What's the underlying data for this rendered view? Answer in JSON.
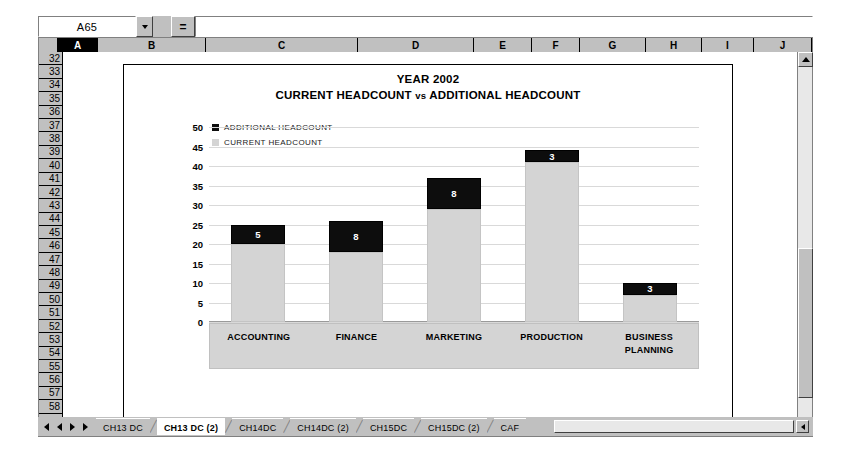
{
  "formula_bar": {
    "name_box_value": "A65",
    "equals_label": "=",
    "formula_value": "",
    "dropdown_icon": "chevron-down-icon"
  },
  "grid": {
    "columns": [
      "A",
      "B",
      "C",
      "D",
      "E",
      "F",
      "G",
      "H",
      "I",
      "J"
    ],
    "column_widths": [
      40,
      108,
      152,
      116,
      58,
      48,
      66,
      56,
      52,
      58
    ],
    "selected_column": "A",
    "rows": [
      32,
      33,
      34,
      35,
      36,
      37,
      38,
      39,
      40,
      41,
      42,
      43,
      44,
      45,
      46,
      47,
      48,
      49,
      50,
      51,
      52,
      53,
      54,
      55,
      56,
      57,
      58
    ]
  },
  "chart_data": {
    "type": "bar",
    "title": "YEAR 2002",
    "subtitle_parts": {
      "left": "CURRENT HEADCOUNT",
      "middle": "vs",
      "right": "ADDITIONAL HEADCOUNT"
    },
    "subtitle": "CURRENT HEADCOUNT vs ADDITIONAL HEADCOUNT",
    "stacked": true,
    "xlabel": "",
    "ylabel": "",
    "ylim": [
      0,
      50
    ],
    "yticks": [
      50,
      45,
      40,
      35,
      30,
      25,
      20,
      15,
      10,
      5,
      0
    ],
    "grid": true,
    "legend_position": "top-left",
    "categories": [
      "ACCOUNTING",
      "FINANCE",
      "MARKETING",
      "PRODUCTION",
      "BUSINESS PLANNING"
    ],
    "series": [
      {
        "name": "ADDITIONAL HEADCOUNT",
        "color": "#0d0d0d",
        "values": [
          5,
          8,
          8,
          3,
          3
        ],
        "labels_shown": true
      },
      {
        "name": "CURRENT HEADCOUNT",
        "color": "#d4d4d4",
        "values": [
          20,
          18,
          29,
          41,
          7
        ],
        "labels_shown": false
      }
    ],
    "totals": [
      25,
      26,
      37,
      44,
      10
    ]
  },
  "sheet_tabs": {
    "nav_icons": [
      "first-icon",
      "previous-icon",
      "next-icon",
      "last-icon"
    ],
    "items": [
      {
        "label": "CH13 DC",
        "active": false
      },
      {
        "label": "CH13 DC (2)",
        "active": true
      },
      {
        "label": "CH14DC",
        "active": false
      },
      {
        "label": "CH14DC (2)",
        "active": false
      },
      {
        "label": "CH15DC",
        "active": false
      },
      {
        "label": "CH15DC (2)",
        "active": false
      },
      {
        "label": "CAF",
        "active": false
      }
    ]
  }
}
